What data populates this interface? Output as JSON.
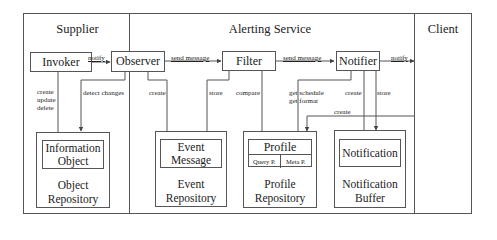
{
  "sections": {
    "supplier": "Supplier",
    "alerting_service": "Alerting Service",
    "client": "Client"
  },
  "components": {
    "invoker": "Invoker",
    "observer": "Observer",
    "filter": "Filter",
    "notifier": "Notifier"
  },
  "repositories": {
    "object": {
      "item": [
        "Information",
        "Object"
      ],
      "name": [
        "Object",
        "Repository"
      ]
    },
    "event": {
      "item": [
        "Event",
        "Message"
      ],
      "name": [
        "Event",
        "Repository"
      ]
    },
    "profile": {
      "item": "Profile",
      "sub": [
        "Query P.",
        "Meta P."
      ],
      "name": [
        "Profile",
        "Repository"
      ]
    },
    "notification": {
      "item": "Notification",
      "name": [
        "Notification",
        "Buffer"
      ]
    }
  },
  "edges": {
    "invoker_observer": "notify",
    "observer_filter": "send message",
    "filter_notifier": "send message",
    "notifier_client": "notify",
    "invoker_object": [
      "create",
      "update",
      "delete"
    ],
    "observer_object": "detect changes",
    "observer_event": "create",
    "filter_event": "store",
    "filter_profile": "compare",
    "notifier_profile": [
      "get schedule",
      "get format"
    ],
    "notifier_notification_create": "create",
    "notifier_notification_store": "store",
    "client_profile": "create"
  }
}
